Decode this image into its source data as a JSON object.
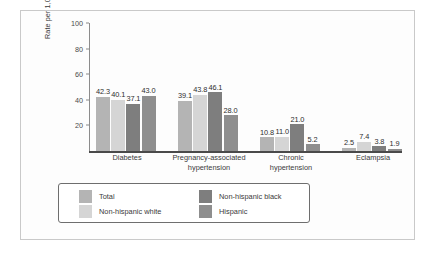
{
  "chart_data": {
    "type": "bar",
    "title": "",
    "xlabel": "",
    "ylabel": "Rate per 1,000 live births",
    "ylim": [
      0,
      100
    ],
    "yticks": [
      20,
      40,
      60,
      80,
      100
    ],
    "grid": false,
    "legend_position": "bottom",
    "categories": [
      "Diabetes",
      "Pregnancy-associated hypertension",
      "Chronic hypertension",
      "Eclampsia"
    ],
    "category_lines": [
      [
        "Diabetes"
      ],
      [
        "Pregnancy-associated",
        "hypertension"
      ],
      [
        "Chronic",
        "hypertension"
      ],
      [
        "Eclampsia"
      ]
    ],
    "series": [
      {
        "name": "Total",
        "color": "#b4b4b4",
        "values": [
          42.3,
          39.1,
          10.8,
          2.5
        ],
        "labels": [
          "42.3",
          "39.1",
          "10.8",
          "2.5"
        ]
      },
      {
        "name": "Non-hispanic white",
        "color": "#d5d5d5",
        "values": [
          40.1,
          43.8,
          11.0,
          7.4
        ],
        "labels": [
          "40.1",
          "43.8",
          "11.0",
          "7.4"
        ]
      },
      {
        "name": "Non-hispanic black",
        "color": "#7e7e7e",
        "values": [
          37.1,
          46.1,
          21.0,
          3.8
        ],
        "labels": [
          "37.1",
          "46.1",
          "21.0",
          "3.8"
        ]
      },
      {
        "name": "Hispanic",
        "color": "#8e8e8e",
        "values": [
          43.0,
          28.0,
          5.2,
          1.9
        ],
        "labels": [
          "43.0",
          "28.0",
          "5.2",
          "1.9"
        ]
      }
    ]
  },
  "legend": {
    "items": [
      {
        "label": "Total",
        "color": "#b4b4b4"
      },
      {
        "label": "Non-hispanic white",
        "color": "#d5d5d5"
      },
      {
        "label": "Non-hispanic black",
        "color": "#7e7e7e"
      },
      {
        "label": "Hispanic",
        "color": "#8e8e8e"
      }
    ]
  }
}
